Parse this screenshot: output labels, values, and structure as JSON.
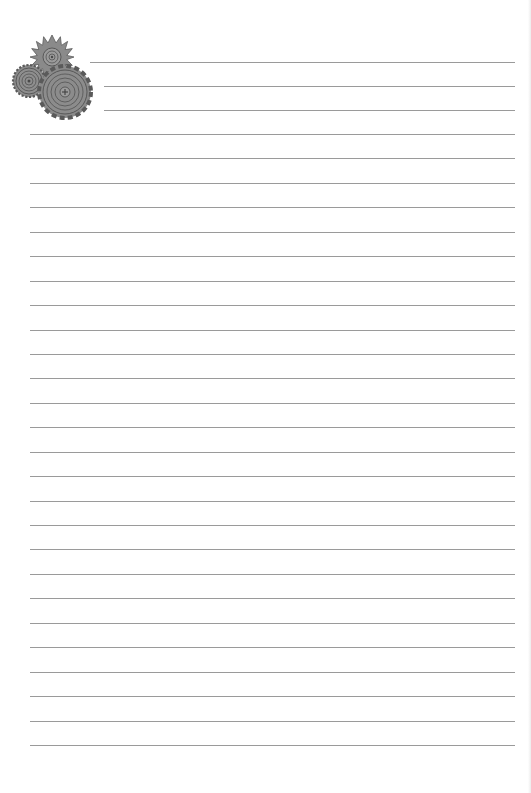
{
  "document": {
    "type": "lined notebook paper",
    "decoration": "gears-icon",
    "colors": {
      "paper": "#ffffff",
      "rule": "#9a9a9a",
      "gear_fill": "#8a8a8a",
      "gear_stroke": "#555555"
    },
    "header_lines": [
      {
        "y": 62,
        "x1": 90,
        "x2": 515
      },
      {
        "y": 86,
        "x1": 104,
        "x2": 515
      },
      {
        "y": 110,
        "x1": 104,
        "x2": 515
      }
    ],
    "body_lines": {
      "start_y": 134,
      "spacing": 24.44,
      "count": 26,
      "x1": 30,
      "x2": 515
    }
  }
}
